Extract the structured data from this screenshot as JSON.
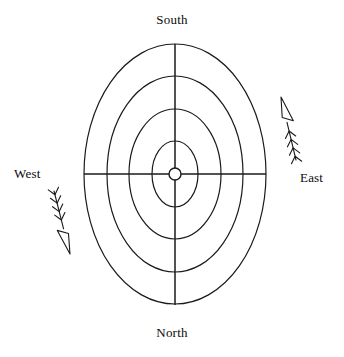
{
  "figure": {
    "type": "polar-compass-diagram",
    "background_color": "#ffffff",
    "stroke_color": "#1a1a1a",
    "width": 344,
    "height": 357
  },
  "labels": {
    "top": "South",
    "bottom": "North",
    "left": "West",
    "right": "East"
  },
  "chart_data": {
    "type": "scatter",
    "title": "",
    "subtitle": "",
    "xlabel": "",
    "ylabel": "",
    "grid": true,
    "legend_position": "none",
    "projection": "polar-elliptical",
    "center": {
      "x": 175,
      "y": 174
    },
    "center_marker": {
      "name": "origin-node",
      "shape": "circle",
      "radius": 6,
      "fill": "#ffffff",
      "stroke": "#1a1a1a"
    },
    "rings": [
      {
        "index": 1,
        "rx": 23,
        "ry": 33
      },
      {
        "index": 2,
        "rx": 46,
        "ry": 65
      },
      {
        "index": 3,
        "rx": 68,
        "ry": 98
      },
      {
        "index": 4,
        "rx": 91,
        "ry": 130
      }
    ],
    "axes": [
      {
        "name": "vertical-axis",
        "from": {
          "x": 175,
          "y": 44
        },
        "to": {
          "x": 175,
          "y": 305
        }
      },
      {
        "name": "horizontal-axis",
        "from": {
          "x": 84,
          "y": 174
        },
        "to": {
          "x": 266,
          "y": 174
        }
      }
    ],
    "tick_labels": [
      "South",
      "East",
      "North",
      "West"
    ],
    "annotations": [
      {
        "name": "east-feathered-arrow",
        "side": "east",
        "direction": "up-left",
        "tip": {
          "x": 281,
          "y": 97
        },
        "tail": {
          "x": 296,
          "y": 160
        },
        "arrowhead": "open",
        "barb_count": 4,
        "barb_direction": "up"
      },
      {
        "name": "west-feathered-arrow",
        "side": "west",
        "direction": "down-right",
        "tip": {
          "x": 70,
          "y": 254
        },
        "tail": {
          "x": 54,
          "y": 191
        },
        "arrowhead": "open",
        "barb_count": 4,
        "barb_direction": "down"
      }
    ]
  }
}
